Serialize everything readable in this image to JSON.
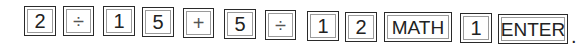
{
  "keystroke_sequence": {
    "keys": [
      {
        "label": "2",
        "type": "digit"
      },
      {
        "label": "÷",
        "type": "operator"
      },
      {
        "label": "1",
        "type": "digit"
      },
      {
        "label": "5",
        "type": "digit"
      },
      {
        "label": "+",
        "type": "operator"
      },
      {
        "label": "5",
        "type": "digit"
      },
      {
        "label": "÷",
        "type": "operator"
      },
      {
        "label": "1",
        "type": "digit"
      },
      {
        "label": "2",
        "type": "digit"
      },
      {
        "label": "MATH",
        "type": "function"
      },
      {
        "label": "1",
        "type": "digit"
      },
      {
        "label": "ENTER",
        "type": "function"
      }
    ],
    "terminator": "."
  }
}
